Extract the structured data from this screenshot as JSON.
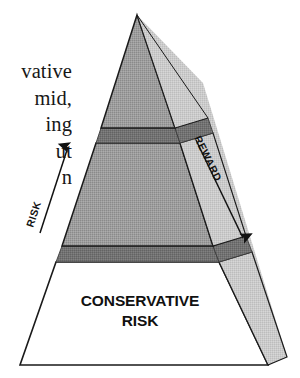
{
  "page": {
    "background_color": "#ffffff",
    "figure_kind": "3d-stacked-pyramid",
    "body_text_lines": [
      "vative",
      "mid,",
      "ing",
      "ut",
      "n"
    ]
  },
  "diagram": {
    "title_visible": false,
    "labels": {
      "risk_arrow": "RISK",
      "reward_arrow": "REWARD",
      "base_tier_line1": "CONSERVATIVE",
      "base_tier_line2": "RISK"
    },
    "tiers": [
      {
        "name": "top-tier",
        "label": "",
        "front_fill": "#9a9a9a",
        "side_fill": "#c9c9c9"
      },
      {
        "name": "middle-tier",
        "label": "",
        "front_fill": "#9a9a9a",
        "side_fill": "#c9c9c9"
      },
      {
        "name": "base-tier",
        "label": "CONSERVATIVE RISK",
        "front_fill": "#ffffff",
        "side_fill": "#bdbdbd"
      }
    ],
    "separators": [
      {
        "name": "upper-separator-band",
        "fill": "#6f6f6f"
      },
      {
        "name": "lower-separator-band",
        "fill": "#6f6f6f"
      }
    ],
    "arrows": [
      {
        "name": "risk-arrow",
        "direction": "up",
        "label": "RISK",
        "color": "#111111"
      },
      {
        "name": "reward-arrow",
        "direction": "down",
        "label": "REWARD",
        "color": "#111111"
      }
    ],
    "colors": {
      "outline": "#1a1a1a",
      "front_face": "#9a9a9a",
      "side_face": "#c9c9c9",
      "separator": "#6f6f6f",
      "base_face": "#ffffff",
      "text": "#111111"
    }
  }
}
